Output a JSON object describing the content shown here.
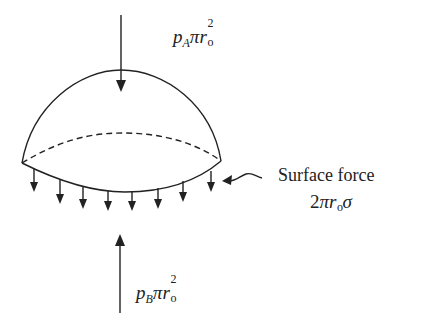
{
  "diagram": {
    "type": "free-body diagram of a spherical cap (bubble/droplet)",
    "top_force": {
      "p": "p",
      "sub": "A",
      "pi": "π",
      "r": "r",
      "r_sub": "o",
      "exp": "2",
      "direction": "down"
    },
    "bottom_force": {
      "p": "p",
      "sub": "B",
      "pi": "π",
      "r": "r",
      "r_sub": "o",
      "exp": "2",
      "direction": "up"
    },
    "surface_force": {
      "label": "Surface force",
      "expr_coef": "2",
      "expr_pi": "π",
      "expr_r": "r",
      "expr_r_sub": "o",
      "expr_sigma": "σ"
    },
    "surface_arrows_count": 9,
    "colors": {
      "stroke": "#222222",
      "background": "#ffffff"
    }
  }
}
